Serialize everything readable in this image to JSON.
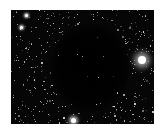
{
  "image": {
    "subject": "dark nebula (Bok globule) against dense starfield",
    "background_color": "#060606",
    "border_color": "#ffffff",
    "bright_stars": [
      {
        "x": 142,
        "y": 60,
        "r": 4
      },
      {
        "x": 73,
        "y": 120,
        "r": 2.5
      },
      {
        "x": 26,
        "y": 15,
        "r": 1.5
      },
      {
        "x": 21,
        "y": 27,
        "r": 1.5
      }
    ]
  }
}
